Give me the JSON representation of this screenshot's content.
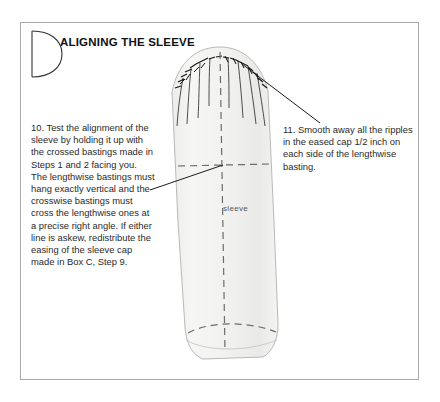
{
  "figure": {
    "dropcap_letter": "D",
    "title": "ALIGNING THE SLEEVE"
  },
  "notes": [
    {
      "id": "step-10",
      "text": "10.  Test the alignment of the sleeve by holding it up with the crossed bastings made in Steps 1 and 2 facing you. The lengthwise bastings must hang exactly vertical and the crosswise bastings must cross the lengthwise ones at a precise right angle. If either line is askew, redistribute the easing of the sleeve cap made in Box C, Step 9."
    },
    {
      "id": "step-11",
      "text": "11.  Smooth away all the ripples in the eased cap 1/2 inch on each side of the lengthwise basting."
    }
  ],
  "illustration": {
    "sleeve_label": "sleeve",
    "colors": {
      "fabric_fill": "#f2f2f0",
      "fabric_edge": "#b9b9b6",
      "basting_dash": "#6b6b6b",
      "ink": "#1c1c1c",
      "frame_border": "#a8a8a8"
    }
  }
}
